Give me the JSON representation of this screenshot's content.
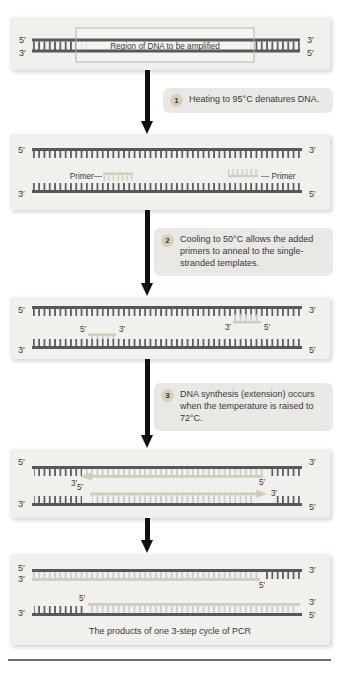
{
  "figure": {
    "caption": "The products of one 3-step cycle of PCR",
    "region_label": "Region of DNA to be amplified"
  },
  "labels": {
    "five_prime": "5′",
    "three_prime": "3′",
    "primer_left": "Primer—",
    "primer_right": "— Primer"
  },
  "steps": [
    {
      "num": "1",
      "text": "Heating to 95°C denatures DNA."
    },
    {
      "num": "2",
      "text": "Cooling to 50°C allows the added primers to anneal to the single-stranded templates."
    },
    {
      "num": "3",
      "text": "DNA synthesis (extension) occurs when the temperature is raised to 72°C."
    }
  ],
  "colors": {
    "panel_bg": "#f1f0ec",
    "step_bg": "#e9e8e4",
    "strand_dark": "#58585a",
    "strand_tan": "#d2ccba",
    "rung_light": "#c9c9c4",
    "badge_bg": "#d8d0ba",
    "text": "#3a3a3a",
    "arrow": "#101010"
  }
}
